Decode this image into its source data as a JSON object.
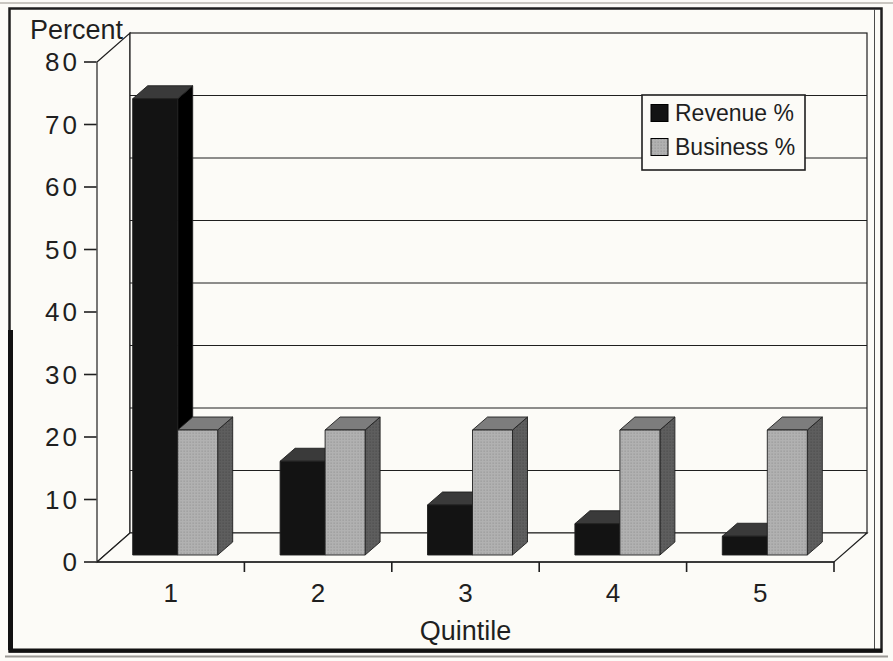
{
  "chart_data": {
    "type": "bar",
    "style": "3d-clustered-column",
    "title": "",
    "ylabel": "Percent",
    "xlabel": "Quintile",
    "categories": [
      "1",
      "2",
      "3",
      "4",
      "5"
    ],
    "series": [
      {
        "name": "Revenue %",
        "values": [
          73,
          15,
          8,
          5,
          3
        ]
      },
      {
        "name": "Business %",
        "values": [
          20,
          20,
          20,
          20,
          20
        ]
      }
    ],
    "ylim": [
      0,
      80
    ],
    "ytick_step": 10,
    "yticks": [
      "0",
      "10",
      "20",
      "30",
      "40",
      "50",
      "60",
      "70",
      "80"
    ],
    "grid": true,
    "legend": {
      "position": "top-right",
      "labels": [
        "Revenue %",
        "Business %"
      ]
    }
  },
  "colors": {
    "paper": "#fcfbf7",
    "ink": "#1f1f1f",
    "revenue_front": "#131313",
    "revenue_top": "#3a3a3a",
    "revenue_side": "#000000",
    "business_front": "#b1b1b1",
    "business_dot": "#8d8d8d",
    "business_top": "#7d7d7d",
    "business_side": "#5e5e5e",
    "business_side_dot": "#454545"
  }
}
